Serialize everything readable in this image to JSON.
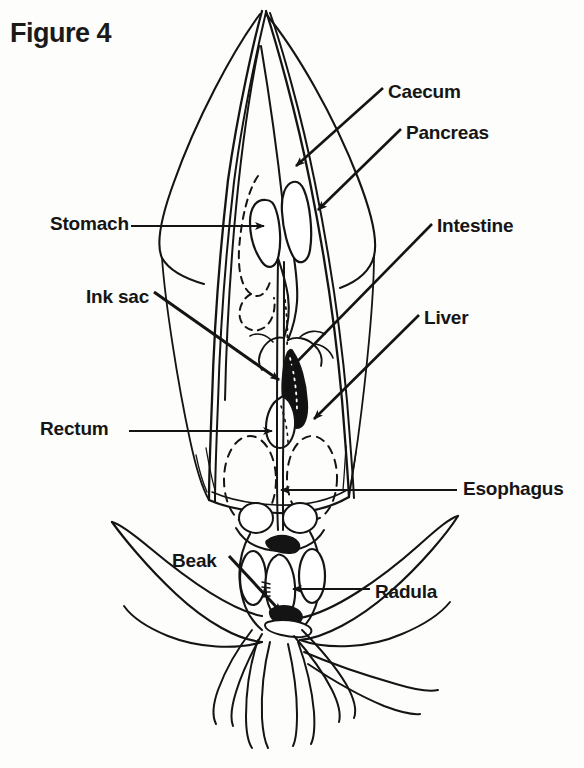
{
  "figure": {
    "title": "Figure 4"
  },
  "colors": {
    "ink": "#141414",
    "background": "#fdfdfc",
    "organ_fill": "#ffffff",
    "ink_sac_fill": "#111111"
  },
  "labels": [
    {
      "id": "caecum",
      "text": "Caecum",
      "x": 388,
      "y": 81,
      "side": "right"
    },
    {
      "id": "pancreas",
      "text": "Pancreas",
      "x": 406,
      "y": 122,
      "side": "right"
    },
    {
      "id": "stomach",
      "text": "Stomach",
      "x": 50,
      "y": 213,
      "side": "left"
    },
    {
      "id": "intestine",
      "text": "Intestine",
      "x": 437,
      "y": 215,
      "side": "right"
    },
    {
      "id": "ink-sac",
      "text": "Ink sac",
      "x": 86,
      "y": 286,
      "side": "left"
    },
    {
      "id": "liver",
      "text": "Liver",
      "x": 424,
      "y": 307,
      "side": "right"
    },
    {
      "id": "rectum",
      "text": "Rectum",
      "x": 40,
      "y": 418,
      "side": "left"
    },
    {
      "id": "esophagus",
      "text": "Esophagus",
      "x": 463,
      "y": 478,
      "side": "right"
    },
    {
      "id": "beak",
      "text": "Beak",
      "x": 172,
      "y": 550,
      "side": "left"
    },
    {
      "id": "radula",
      "text": "Radula",
      "x": 375,
      "y": 581,
      "side": "right"
    }
  ],
  "leader_lines": [
    {
      "id": "caecum-leader",
      "label": "Caecum",
      "from_x": 383,
      "from_y": 88,
      "to_x": 296,
      "to_y": 166
    },
    {
      "id": "pancreas-leader",
      "label": "Pancreas",
      "from_x": 401,
      "from_y": 129,
      "to_x": 318,
      "to_y": 210
    },
    {
      "id": "stomach-leader",
      "label": "Stomach",
      "from_x": 131,
      "from_y": 226,
      "to_x": 264,
      "to_y": 226
    },
    {
      "id": "intestine-leader",
      "label": "Intestine",
      "from_x": 432,
      "from_y": 224,
      "to_x": 283,
      "to_y": 375
    },
    {
      "id": "ink-sac-leader",
      "label": "Ink sac",
      "from_x": 154,
      "from_y": 292,
      "to_x": 281,
      "to_y": 381
    },
    {
      "id": "liver-leader",
      "label": "Liver",
      "from_x": 419,
      "from_y": 315,
      "to_x": 312,
      "to_y": 420
    },
    {
      "id": "rectum-leader",
      "label": "Rectum",
      "from_x": 129,
      "from_y": 431,
      "to_x": 272,
      "to_y": 431
    },
    {
      "id": "esophagus-leader",
      "label": "Esophagus",
      "from_x": 457,
      "from_y": 490,
      "to_x": 279,
      "to_y": 490
    },
    {
      "id": "beak-leader",
      "label": "Beak",
      "from_x": 229,
      "from_y": 558,
      "to_x": 283,
      "to_y": 614
    },
    {
      "id": "radula-leader",
      "label": "Radula",
      "from_x": 370,
      "from_y": 589,
      "to_x": 291,
      "to_y": 589
    }
  ],
  "anatomy_parts": [
    "mantle-outline",
    "fin-left",
    "fin-right",
    "gladius-pen",
    "stomach-organ",
    "caecum-organ",
    "pancreas-organ",
    "intestine-tract",
    "liver-organ",
    "ink-sac-organ",
    "rectum-organ",
    "esophagus-tube",
    "gill-left",
    "gill-right",
    "funnel",
    "beak-organ",
    "radula-organ",
    "arms",
    "tentacles"
  ]
}
